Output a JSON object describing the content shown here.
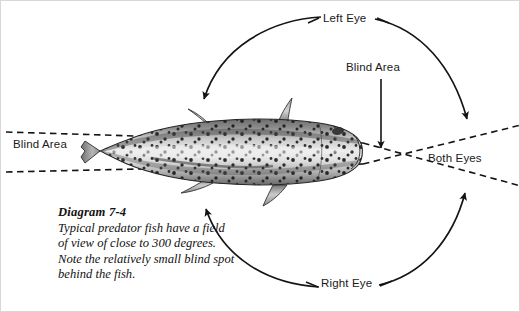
{
  "figure": {
    "type": "anatomical-field-of-view-diagram",
    "background_color": "#ffffff",
    "ink_color": "#1a1a1a"
  },
  "labels": {
    "left_eye": "Left Eye",
    "right_eye": "Right Eye",
    "blind_area_top": "Blind Area",
    "blind_area_left": "Blind Area",
    "both_eyes": "Both Eyes"
  },
  "caption": {
    "title": "Diagram 7-4",
    "body": "Typical predator fish have a field of view of close to 300 degrees. Note the relatively small blind spot behind the fish.",
    "lines": [
      "Typical predator fish have a field",
      "of view of close to 300 degrees.",
      "Note the relatively small blind spot",
      "behind the fish."
    ]
  },
  "values": {
    "field_of_view_degrees": 300
  },
  "annotations": {
    "left_eye_arc": "arc sweeping over the top of the fish from the dorsal fin to the forward right, ending in an arrowhead on the upper sight line",
    "right_eye_arc": "arc sweeping under the fish from the anal fin to the forward right, ending in an arrowhead on the lower sight line",
    "blind_area_pointer": "vertical arrow from the Blind Area label down to the fish snout",
    "blind_area_wedge": "dashed lines extending rearward past the tail marking the blind zone",
    "both_eyes_wedge": "dashed lines crossing ahead of the snout marking the binocular overlap zone"
  }
}
